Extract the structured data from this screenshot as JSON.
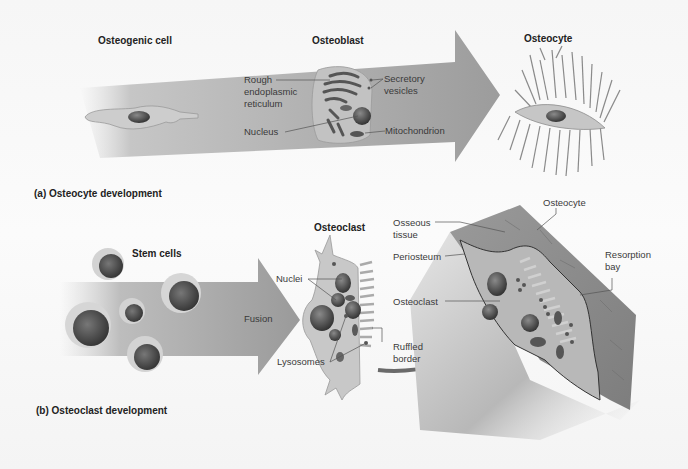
{
  "panel_a": {
    "caption": "(a) Osteocyte development",
    "stages": {
      "osteogenic_cell": "Osteogenic cell",
      "osteoblast": "Osteoblast",
      "osteocyte": "Osteocyte"
    },
    "osteoblast_labels": {
      "rough_er": "Rough\nendoplasmic\nreticulum",
      "nucleus": "Nucleus",
      "secretory_vesicles": "Secretory\nvesicles",
      "mitochondrion": "Mitochondrion"
    }
  },
  "panel_b": {
    "caption": "(b) Osteoclast development",
    "stem_cells": "Stem cells",
    "fusion": "Fusion",
    "osteoclast_title": "Osteoclast",
    "osteoclast_labels": {
      "nuclei": "Nuclei",
      "lysosomes": "Lysosomes",
      "ruffled_border": "Ruffled\nborder"
    },
    "bone_labels": {
      "osseous_tissue": "Osseous\ntissue",
      "periosteum": "Periosteum",
      "osteoclast": "Osteoclast",
      "osteocyte": "Osteocyte",
      "resorption_bay": "Resorption\nbay"
    }
  },
  "colors": {
    "arrow": "#a9a9a9",
    "cell": "#c9c9c9",
    "nucleus": "#4a4a4a",
    "bone": "#8f8f8f",
    "text": "#333333"
  }
}
